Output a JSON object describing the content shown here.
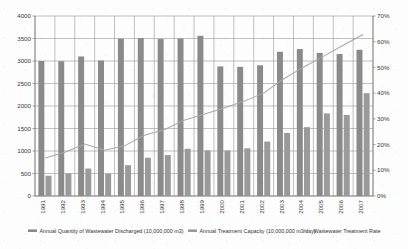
{
  "chart_data": {
    "type": "bar",
    "title": "",
    "subtitle": "",
    "xlabel": "",
    "ylabel": "",
    "y2label": "",
    "grid": true,
    "legend_position": "bottom",
    "categories": [
      "1991",
      "1992",
      "1993",
      "1994",
      "1995",
      "1996",
      "1997",
      "1998",
      "1999",
      "2000",
      "2001",
      "2002",
      "2003",
      "2004",
      "2005",
      "2006",
      "2007"
    ],
    "ylim": [
      0,
      4000
    ],
    "ytick_step": 500,
    "yticks": [
      "0",
      "500",
      "1000",
      "1500",
      "2000",
      "2500",
      "3000",
      "3500",
      "4000"
    ],
    "y2lim": [
      0,
      70
    ],
    "y2tick_step": 10,
    "y2ticks": [
      "0%",
      "10%",
      "20%",
      "30%",
      "40%",
      "50%",
      "60%",
      "70%"
    ],
    "series": [
      {
        "name": "Annual Quantity of Wastewater Discharged (10,000,000 m3)",
        "axis": "left",
        "kind": "bar",
        "color": "#8a8a8a",
        "values": [
          3000,
          2995,
          3100,
          3010,
          3495,
          3510,
          3490,
          3500,
          3560,
          2880,
          2870,
          2905,
          3205,
          3265,
          3180,
          3155,
          3250
        ]
      },
      {
        "name": "Annual Treatment Capacity (10,000,000 m3/day)",
        "axis": "left",
        "kind": "bar",
        "color": "#9a9a9a",
        "values": [
          450,
          500,
          610,
          495,
          685,
          850,
          910,
          1050,
          1015,
          1010,
          1060,
          1210,
          1400,
          1530,
          1835,
          1800,
          2285
        ]
      },
      {
        "name": "Wastewater Treatment Rate",
        "axis": "right",
        "kind": "line",
        "color": "#a8a8a8",
        "values": [
          14.8,
          17.0,
          20.2,
          17.8,
          19.5,
          23.6,
          25.8,
          29.5,
          31.8,
          34.2,
          36.8,
          40.0,
          45.5,
          50.1,
          54.3,
          58.6,
          62.8
        ]
      }
    ]
  },
  "legend": {
    "items": [
      {
        "label": "Annual Quantity of Wastewater Discharged (10,000,000 m3)",
        "marker": "bar-swatch"
      },
      {
        "label": "Annual Treatment Capacity (10,000,000 m3/day)",
        "marker": "bar-swatch"
      },
      {
        "label": "Wastewater Treatment Rate",
        "marker": "line-swatch"
      }
    ]
  }
}
